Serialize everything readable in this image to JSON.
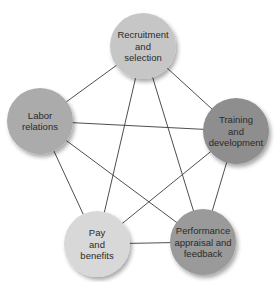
{
  "diagram": {
    "type": "network",
    "nodes": [
      {
        "id": "recruitment",
        "lines": [
          "Recruitment",
          "and",
          "selection"
        ],
        "cx": 143,
        "cy": 46,
        "r": 33,
        "fill": "#c6c6c6"
      },
      {
        "id": "training",
        "lines": [
          "Training",
          "and",
          "development"
        ],
        "cx": 236,
        "cy": 131,
        "r": 33,
        "fill": "#8e8e8e"
      },
      {
        "id": "performance",
        "lines": [
          "Performance",
          "appraisal and",
          "feedback"
        ],
        "cx": 203,
        "cy": 242,
        "r": 33,
        "fill": "#9a9a9a"
      },
      {
        "id": "pay",
        "lines": [
          "Pay",
          "and",
          "benefits"
        ],
        "cx": 97,
        "cy": 244,
        "r": 33,
        "fill": "#d8d8d8"
      },
      {
        "id": "labor",
        "lines": [
          "Labor",
          "relations"
        ],
        "cx": 40,
        "cy": 121,
        "r": 33,
        "fill": "#ababab"
      }
    ],
    "edges": [
      [
        "recruitment",
        "training"
      ],
      [
        "training",
        "performance"
      ],
      [
        "performance",
        "pay"
      ],
      [
        "pay",
        "labor"
      ],
      [
        "labor",
        "recruitment"
      ],
      [
        "recruitment",
        "performance"
      ],
      [
        "recruitment",
        "pay"
      ],
      [
        "labor",
        "training"
      ],
      [
        "labor",
        "performance"
      ],
      [
        "pay",
        "training"
      ]
    ]
  }
}
